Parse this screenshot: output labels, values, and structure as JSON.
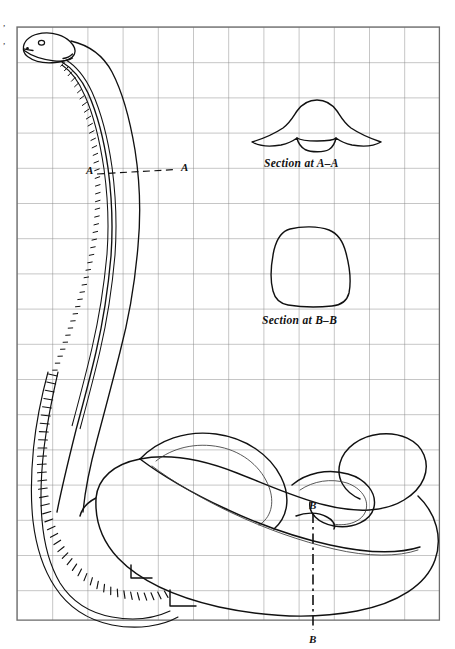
{
  "figure": {
    "title_visible": false,
    "background_color": "#ffffff",
    "ink_color": "#111111",
    "grid_color": "#808080",
    "grid": {
      "x0": 17,
      "y0": 27,
      "cell": 35.2,
      "cols": 12,
      "rows": 16.85,
      "border_color": "#6e6e6e"
    },
    "edge_marks": [
      "’",
      "’"
    ],
    "captions": [
      {
        "id": "section-a",
        "text": "Section at A–A",
        "x": 264,
        "y": 165
      },
      {
        "id": "section-b",
        "text": "Section at B–B",
        "x": 262,
        "y": 322
      }
    ],
    "section_markers": [
      {
        "id": "a-left",
        "text": "A",
        "x": 88,
        "y": 172
      },
      {
        "id": "a-right",
        "text": "A",
        "x": 182,
        "y": 170
      },
      {
        "id": "b-upper",
        "text": "B",
        "x": 310,
        "y": 507
      },
      {
        "id": "b-lower",
        "text": "B",
        "x": 310,
        "y": 641
      }
    ],
    "views": [
      "profile outline with vertebral column",
      "cross section at A-A",
      "cross section at B-B"
    ]
  }
}
